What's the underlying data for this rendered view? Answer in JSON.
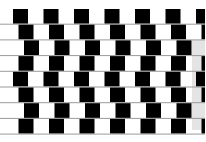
{
  "pattern": {
    "rows": 8,
    "tiles_per_row": 7,
    "row_shift_sequence": [
      0,
      1,
      2,
      1,
      0,
      1,
      2,
      1
    ],
    "tile_color": "#000000",
    "background_color": "#ffffff",
    "mortar_color": "#9a9a9a",
    "edge_fill_color": "#e4e4e4"
  }
}
